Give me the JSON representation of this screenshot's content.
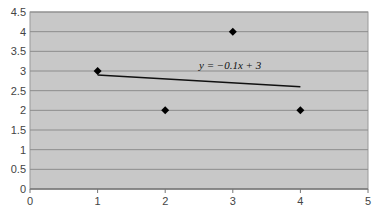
{
  "chart_data": {
    "type": "scatter",
    "title": "",
    "xlabel": "",
    "ylabel": "",
    "xlim": [
      0,
      5
    ],
    "ylim": [
      0,
      4.5
    ],
    "x_ticks": [
      "0",
      "1",
      "2",
      "3",
      "4",
      "5"
    ],
    "y_ticks": [
      "0",
      "0.5",
      "1",
      "1.5",
      "2",
      "2.5",
      "3",
      "3.5",
      "4",
      "4.5"
    ],
    "grid": {
      "horizontal": true,
      "vertical": false
    },
    "legend": null,
    "series": [
      {
        "name": "data points",
        "marker": "diamond",
        "color": "#000000",
        "points": [
          {
            "x": 1,
            "y": 3
          },
          {
            "x": 2,
            "y": 2
          },
          {
            "x": 3,
            "y": 4
          },
          {
            "x": 4,
            "y": 2
          }
        ]
      },
      {
        "name": "trendline",
        "type": "line",
        "color": "#000000",
        "points": [
          {
            "x": 1,
            "y": 2.9
          },
          {
            "x": 4,
            "y": 2.6
          }
        ]
      }
    ],
    "annotations": [
      {
        "text": "y = −0.1x + 3",
        "x": 2.5,
        "y": 3.05
      }
    ]
  },
  "colors": {
    "plot_background": "#c8c8c8",
    "grid": "#8c8c8c",
    "marker": "#000000"
  }
}
